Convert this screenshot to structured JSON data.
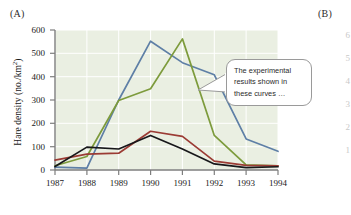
{
  "panels": {
    "a_label": "(A)",
    "b_label": "(B)"
  },
  "callout": {
    "text": "The experimental results shown in these curves …"
  },
  "colors": {
    "plot_background": "#eaefe2",
    "axis": "#7e7e7e",
    "grid": "#ffffff",
    "series_blue": "#5e7fa6",
    "series_green": "#7d9b3c",
    "series_red": "#9b3b34",
    "series_black": "#17171a",
    "callout_border": "#9a9a9a"
  },
  "chart_data": {
    "type": "line",
    "title": "",
    "xlabel": "",
    "ylabel": "Hare density (no./km2)",
    "ylabel_html": "Hare density (no./km<sup>2</sup>)",
    "x": [
      1987,
      1988,
      1989,
      1990,
      1991,
      1992,
      1993,
      1994
    ],
    "xticklabels": [
      "1987",
      "1988",
      "1989",
      "1990",
      "1991",
      "1992",
      "1993",
      "1994"
    ],
    "yticklabels": [
      "0",
      "100",
      "200",
      "300",
      "400",
      "500",
      "600"
    ],
    "yticks": [
      0,
      100,
      200,
      300,
      400,
      500,
      600
    ],
    "xlim": [
      1987,
      1994
    ],
    "ylim": [
      0,
      600
    ],
    "grid": true,
    "legend": "none",
    "series": [
      {
        "name": "blue-curve",
        "color": "#5e7fa6",
        "values": [
          12,
          8,
          300,
          552,
          460,
          408,
          133,
          80
        ]
      },
      {
        "name": "green-curve",
        "color": "#7d9b3c",
        "values": [
          18,
          58,
          298,
          348,
          562,
          148,
          22,
          18
        ]
      },
      {
        "name": "red-curve",
        "color": "#9b3b34",
        "values": [
          42,
          68,
          72,
          166,
          144,
          38,
          20,
          18
        ]
      },
      {
        "name": "black-curve",
        "color": "#17171a",
        "values": [
          15,
          98,
          90,
          148,
          90,
          26,
          10,
          14
        ]
      }
    ]
  },
  "figure_b": {
    "partial_yticklabels": [
      "6",
      "5",
      "4",
      "3",
      "2",
      "1"
    ]
  }
}
